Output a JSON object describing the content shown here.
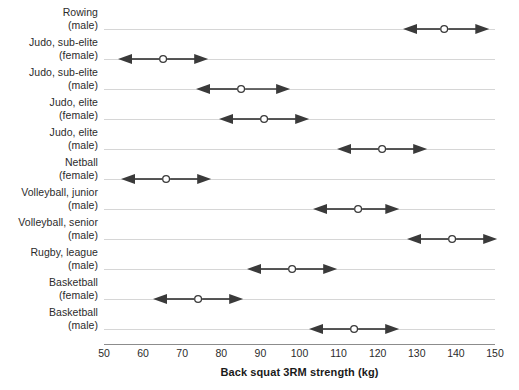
{
  "chart_data": {
    "type": "scatter",
    "title": "",
    "xlabel": "Back squat 3RM strength (kg)",
    "ylabel": "",
    "xlim": [
      50,
      150
    ],
    "xticks": [
      50,
      60,
      70,
      80,
      90,
      100,
      110,
      120,
      130,
      140,
      150
    ],
    "xtick_labels": [
      "50",
      "60",
      "70",
      "80",
      "90",
      "100",
      "110",
      "120",
      "130",
      "140",
      "150"
    ],
    "grid": "horizontal-row-lines",
    "legend": "none",
    "marker_style": "open-circle-with-double-headed-arrow-range",
    "units": "kg",
    "categories": [
      "Rowing (male)",
      "Judo, sub-elite (female)",
      "Judo, sub-elite (male)",
      "Judo, elite (female)",
      "Judo, elite (male)",
      "Netball (female)",
      "Volleyball, junior (male)",
      "Volleyball, senior (male)",
      "Rugby, league (male)",
      "Basketball (female)",
      "Basketball (male)"
    ],
    "series": [
      {
        "name": "Back squat 3RM strength",
        "points": [
          {
            "category": "Rowing (male)",
            "label_line1": "Rowing",
            "label_line2": "(male)",
            "low": 128,
            "value": 137,
            "high": 147
          },
          {
            "category": "Judo, sub-elite (female)",
            "label_line1": "Judo, sub-elite",
            "label_line2": "(female)",
            "low": 55,
            "value": 65,
            "high": 75
          },
          {
            "category": "Judo, sub-elite (male)",
            "label_line1": "Judo, sub-elite",
            "label_line2": "(male)",
            "low": 75,
            "value": 85,
            "high": 96
          },
          {
            "category": "Judo, elite (female)",
            "label_line1": "Judo, elite",
            "label_line2": "(female)",
            "low": 81,
            "value": 91,
            "high": 101
          },
          {
            "category": "Judo, elite (male)",
            "label_line1": "Judo, elite",
            "label_line2": "(male)",
            "low": 111,
            "value": 121,
            "high": 131
          },
          {
            "category": "Netball (female)",
            "label_line1": "Netball",
            "label_line2": "(female)",
            "low": 56,
            "value": 66,
            "high": 76
          },
          {
            "category": "Volleyball, junior (male)",
            "label_line1": "Volleyball, junior",
            "label_line2": "(male)",
            "low": 105,
            "value": 115,
            "high": 124
          },
          {
            "category": "Volleyball, senior (male)",
            "label_line1": "Volleyball, senior",
            "label_line2": "(male)",
            "low": 129,
            "value": 139,
            "high": 149
          },
          {
            "category": "Rugby, league (male)",
            "label_line1": "Rugby, league",
            "label_line2": "(male)",
            "low": 88,
            "value": 98,
            "high": 108
          },
          {
            "category": "Basketball (female)",
            "label_line1": "Basketball",
            "label_line2": "(female)",
            "low": 64,
            "value": 74,
            "high": 84
          },
          {
            "category": "Basketball (male)",
            "label_line1": "Basketball",
            "label_line2": "(male)",
            "low": 104,
            "value": 114,
            "high": 124
          }
        ]
      }
    ],
    "colors": {
      "arrow": "#3a3a3a",
      "marker_fill": "#ffffff",
      "marker_stroke": "#3a3a3a",
      "gridline": "#d6d6d6",
      "axis": "#8c8c8c",
      "text": "#2b2b2b",
      "background": "#ffffff"
    }
  }
}
